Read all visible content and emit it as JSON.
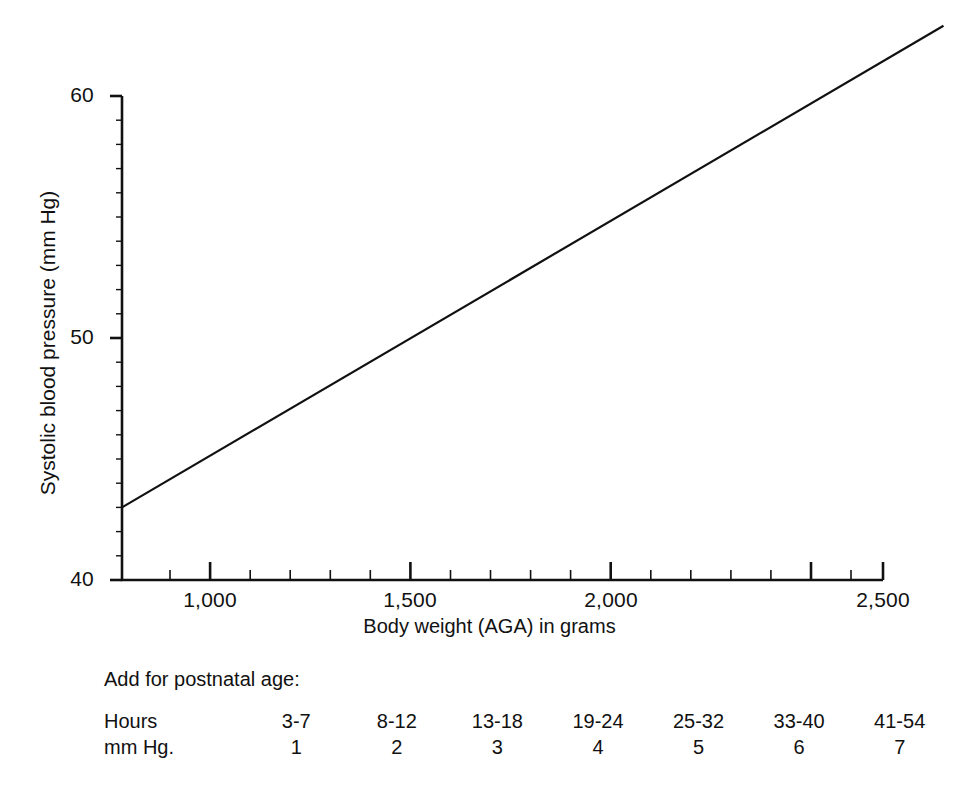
{
  "chart_data": {
    "type": "line",
    "title": "",
    "xlabel": "Body weight (AGA) in grams",
    "ylabel": "Systolic blood pressure (mm Hg)",
    "xlim": [
      740,
      2640
    ],
    "ylim": [
      40,
      60
    ],
    "grid": false,
    "legend": "none",
    "x_major_ticks": [
      1000,
      1500,
      2000,
      2500
    ],
    "x_major_tick_labels": [
      "1,000",
      "1,500",
      "2,000",
      "2,500"
    ],
    "x_minor_tick_step": 100,
    "y_major_ticks": [
      40,
      50,
      60
    ],
    "y_major_tick_labels": [
      "40",
      "50",
      "60"
    ],
    "y_minor_tick_step": 1,
    "series": [
      {
        "name": "Systolic blood pressure",
        "x": [
          740,
          1000,
          1500,
          2000,
          2500,
          2640
        ],
        "values": [
          43.0,
          45.7,
          50.9,
          56.2,
          61.4,
          62.9
        ]
      }
    ],
    "annotations": []
  },
  "axis": {
    "y_tick_labels": [
      "60",
      "50",
      "40"
    ],
    "x_tick_labels": [
      "1,000",
      "1,500",
      "2,000",
      "2,500"
    ],
    "y_title": "Systolic blood pressure (mm Hg)",
    "x_title": "Body weight (AGA) in grams"
  },
  "addendum": {
    "title": "Add for postnatal age:",
    "rows": [
      {
        "label": "Hours",
        "cells": [
          "3-7",
          "8-12",
          "13-18",
          "19-24",
          "25-32",
          "33-40",
          "41-54"
        ]
      },
      {
        "label": "mm Hg.",
        "cells": [
          "1",
          "2",
          "3",
          "4",
          "5",
          "6",
          "7"
        ]
      }
    ]
  }
}
